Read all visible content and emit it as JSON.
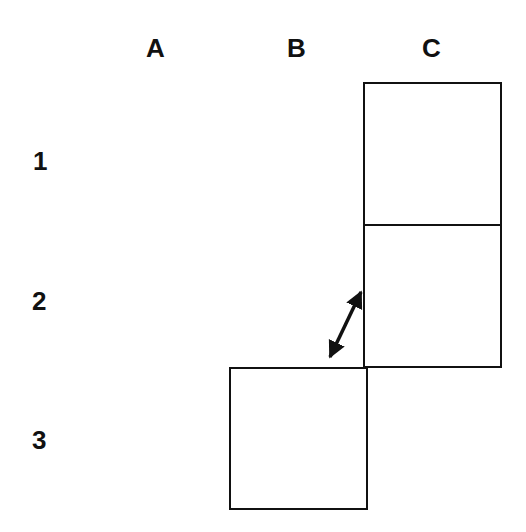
{
  "columns": [
    {
      "label": "A",
      "x": 158
    },
    {
      "label": "B",
      "x": 297
    },
    {
      "label": "C",
      "x": 433
    }
  ],
  "rows": [
    {
      "label": "1",
      "y": 160
    },
    {
      "label": "2",
      "y": 300
    },
    {
      "label": "3",
      "y": 440
    }
  ],
  "cells": [
    {
      "id": "C1",
      "x": 364,
      "y": 83,
      "w": 137,
      "h": 142
    },
    {
      "id": "C2",
      "x": 364,
      "y": 225,
      "w": 137,
      "h": 142
    },
    {
      "id": "B3",
      "x": 230,
      "y": 368,
      "w": 137,
      "h": 141
    }
  ],
  "arrow": {
    "type": "double-headed",
    "from": {
      "x": 364,
      "y": 287
    },
    "to": {
      "x": 327,
      "y": 362
    },
    "color": "#111111"
  },
  "stroke_color": "#111111"
}
